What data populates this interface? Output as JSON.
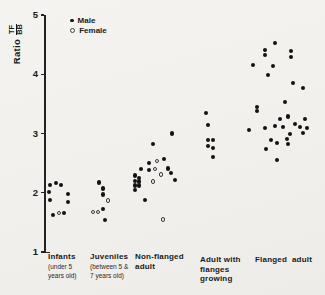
{
  "figure": {
    "background": "#f1f0ed",
    "ink": "#1a1a1a"
  },
  "chart_data": {
    "type": "scatter",
    "title": "",
    "ylabel_prefix": "Ratio",
    "ylabel_fraction": {
      "numerator": "TF",
      "denominator": "BB"
    },
    "ylabel": "Ratio TF/BB",
    "xlabel": "",
    "ylim": [
      1,
      5
    ],
    "yticks": [
      5,
      4,
      3,
      2,
      1
    ],
    "grid": false,
    "legend_position": "top-inset",
    "series": [
      {
        "name": "Male",
        "marker": "filled-circle"
      },
      {
        "name": "Female",
        "marker": "open-circle"
      }
    ],
    "categories": [
      {
        "label_main": [
          "Infants"
        ],
        "label_sub": [
          "(under 5",
          "years old)"
        ],
        "label_x": 48,
        "label_y": 252,
        "points": [
          {
            "x": 50,
            "ratio": 2.13,
            "sex": "M"
          },
          {
            "x": 56,
            "ratio": 2.16,
            "sex": "M"
          },
          {
            "x": 61,
            "ratio": 2.13,
            "sex": "M"
          },
          {
            "x": 49,
            "ratio": 2.01,
            "sex": "M"
          },
          {
            "x": 68,
            "ratio": 1.98,
            "sex": "M"
          },
          {
            "x": 50,
            "ratio": 1.88,
            "sex": "M"
          },
          {
            "x": 68,
            "ratio": 1.84,
            "sex": "M"
          },
          {
            "x": 53,
            "ratio": 1.62,
            "sex": "M"
          },
          {
            "x": 59,
            "ratio": 1.66,
            "sex": "F"
          },
          {
            "x": 64,
            "ratio": 1.66,
            "sex": "M"
          }
        ]
      },
      {
        "label_main": [
          "Juveniles"
        ],
        "label_sub": [
          "(between 5 &",
          "7 years old)"
        ],
        "label_x": 90,
        "label_y": 252,
        "points": [
          {
            "x": 99,
            "ratio": 2.17,
            "sex": "M"
          },
          {
            "x": 103,
            "ratio": 2.07,
            "sex": "M"
          },
          {
            "x": 103,
            "ratio": 1.97,
            "sex": "M"
          },
          {
            "x": 108,
            "ratio": 1.87,
            "sex": "F"
          },
          {
            "x": 103,
            "ratio": 1.73,
            "sex": "M"
          },
          {
            "x": 93,
            "ratio": 1.68,
            "sex": "F"
          },
          {
            "x": 98,
            "ratio": 1.68,
            "sex": "F"
          },
          {
            "x": 105,
            "ratio": 1.54,
            "sex": "M"
          }
        ]
      },
      {
        "label_main": [
          "Non-flanged",
          "adult"
        ],
        "label_sub": [],
        "label_x": 135,
        "label_y": 252,
        "points": [
          {
            "x": 172,
            "ratio": 3.0,
            "sex": "M"
          },
          {
            "x": 153,
            "ratio": 2.82,
            "sex": "M"
          },
          {
            "x": 164,
            "ratio": 2.57,
            "sex": "M"
          },
          {
            "x": 157,
            "ratio": 2.54,
            "sex": "F"
          },
          {
            "x": 149,
            "ratio": 2.5,
            "sex": "M"
          },
          {
            "x": 168,
            "ratio": 2.41,
            "sex": "M"
          },
          {
            "x": 141,
            "ratio": 2.4,
            "sex": "M"
          },
          {
            "x": 155,
            "ratio": 2.4,
            "sex": "F"
          },
          {
            "x": 149,
            "ratio": 2.38,
            "sex": "M"
          },
          {
            "x": 171,
            "ratio": 2.33,
            "sex": "M"
          },
          {
            "x": 161,
            "ratio": 2.31,
            "sex": "F"
          },
          {
            "x": 135,
            "ratio": 2.29,
            "sex": "M"
          },
          {
            "x": 139,
            "ratio": 2.25,
            "sex": "M"
          },
          {
            "x": 175,
            "ratio": 2.22,
            "sex": "M"
          },
          {
            "x": 135,
            "ratio": 2.2,
            "sex": "M"
          },
          {
            "x": 139,
            "ratio": 2.19,
            "sex": "M"
          },
          {
            "x": 153,
            "ratio": 2.19,
            "sex": "F"
          },
          {
            "x": 135,
            "ratio": 2.12,
            "sex": "M"
          },
          {
            "x": 139,
            "ratio": 2.12,
            "sex": "M"
          },
          {
            "x": 135,
            "ratio": 2.05,
            "sex": "M"
          },
          {
            "x": 145,
            "ratio": 1.88,
            "sex": "M"
          },
          {
            "x": 163,
            "ratio": 1.55,
            "sex": "F"
          }
        ]
      },
      {
        "label_main": [
          "Adult with",
          "flanges",
          "growing"
        ],
        "label_sub": [],
        "label_x": 200,
        "label_y": 255,
        "points": [
          {
            "x": 206,
            "ratio": 3.35,
            "sex": "M"
          },
          {
            "x": 208,
            "ratio": 3.14,
            "sex": "M"
          },
          {
            "x": 208,
            "ratio": 2.89,
            "sex": "M"
          },
          {
            "x": 213,
            "ratio": 2.89,
            "sex": "M"
          },
          {
            "x": 208,
            "ratio": 2.79,
            "sex": "M"
          },
          {
            "x": 213,
            "ratio": 2.76,
            "sex": "M"
          },
          {
            "x": 213,
            "ratio": 2.6,
            "sex": "M"
          }
        ]
      },
      {
        "label_main": [
          "Flanged  adult"
        ],
        "label_sub": [],
        "label_x": 255,
        "label_y": 255,
        "points": [
          {
            "x": 275,
            "ratio": 4.53,
            "sex": "M"
          },
          {
            "x": 265,
            "ratio": 4.41,
            "sex": "M"
          },
          {
            "x": 291,
            "ratio": 4.39,
            "sex": "M"
          },
          {
            "x": 265,
            "ratio": 4.32,
            "sex": "M"
          },
          {
            "x": 291,
            "ratio": 4.29,
            "sex": "M"
          },
          {
            "x": 253,
            "ratio": 4.16,
            "sex": "M"
          },
          {
            "x": 273,
            "ratio": 4.14,
            "sex": "M"
          },
          {
            "x": 268,
            "ratio": 3.99,
            "sex": "M"
          },
          {
            "x": 293,
            "ratio": 3.85,
            "sex": "M"
          },
          {
            "x": 303,
            "ratio": 3.77,
            "sex": "M"
          },
          {
            "x": 285,
            "ratio": 3.53,
            "sex": "M"
          },
          {
            "x": 257,
            "ratio": 3.45,
            "sex": "M"
          },
          {
            "x": 257,
            "ratio": 3.38,
            "sex": "M"
          },
          {
            "x": 288,
            "ratio": 3.29,
            "sex": "M"
          },
          {
            "x": 280,
            "ratio": 3.24,
            "sex": "M"
          },
          {
            "x": 305,
            "ratio": 3.24,
            "sex": "M"
          },
          {
            "x": 295,
            "ratio": 3.16,
            "sex": "M"
          },
          {
            "x": 275,
            "ratio": 3.13,
            "sex": "M"
          },
          {
            "x": 283,
            "ratio": 3.11,
            "sex": "M"
          },
          {
            "x": 300,
            "ratio": 3.11,
            "sex": "M"
          },
          {
            "x": 307,
            "ratio": 3.09,
            "sex": "M"
          },
          {
            "x": 265,
            "ratio": 3.09,
            "sex": "M"
          },
          {
            "x": 249,
            "ratio": 3.06,
            "sex": "M"
          },
          {
            "x": 303,
            "ratio": 3.01,
            "sex": "M"
          },
          {
            "x": 290,
            "ratio": 2.99,
            "sex": "M"
          },
          {
            "x": 287,
            "ratio": 2.91,
            "sex": "M"
          },
          {
            "x": 271,
            "ratio": 2.89,
            "sex": "M"
          },
          {
            "x": 277,
            "ratio": 2.84,
            "sex": "M"
          },
          {
            "x": 288,
            "ratio": 2.82,
            "sex": "M"
          },
          {
            "x": 266,
            "ratio": 2.74,
            "sex": "M"
          },
          {
            "x": 277,
            "ratio": 2.55,
            "sex": "M"
          }
        ]
      }
    ]
  }
}
